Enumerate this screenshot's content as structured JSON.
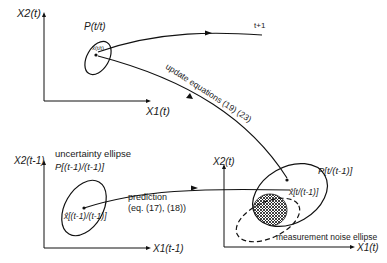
{
  "diagram": {
    "panels": {
      "top": {
        "axis_y": "X2(t)",
        "axis_x": "X1(t)",
        "covariance_label": "P(t/t)",
        "estimate_label": "x̂(t/t)"
      },
      "bottom_left": {
        "axis_y": "X2(t-1)",
        "axis_x": "X1(t-1)",
        "ellipse_caption": "uncertainty ellipse",
        "covariance_label": "P[(t-1)/(t-1)]",
        "estimate_label": "x̂[(t-1)/(t-1)]"
      },
      "bottom_right": {
        "axis_y": "X2(t)",
        "axis_x": "X1(t)",
        "covariance_label": "P[t/(t-1)]",
        "estimate_label": "x̂[t/(t-1)]",
        "noise_label": "measurement noise ellipse"
      }
    },
    "arrows": {
      "prediction": "prediction",
      "prediction_eq": "(eq. (17), (18))",
      "update": "update equations (19) (23)",
      "next_step": "t+1"
    }
  }
}
